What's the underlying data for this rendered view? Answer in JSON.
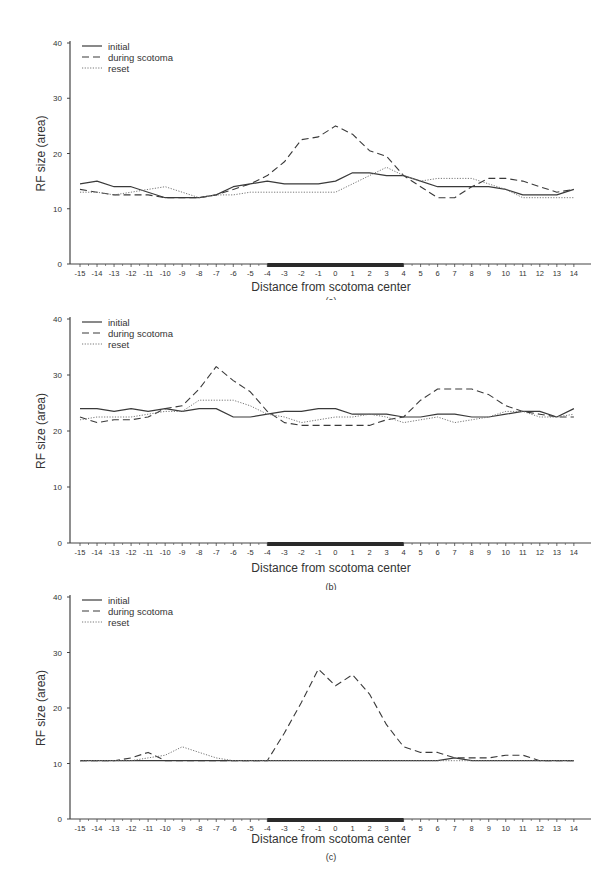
{
  "chart_data": [
    {
      "type": "line",
      "panel_label": "(a)",
      "title": "",
      "xlabel": "Distance from scotoma center",
      "ylabel": "RF size (area)",
      "ylim": [
        0,
        40
      ],
      "xlim": [
        -15,
        14
      ],
      "yticks": [
        0,
        10,
        20,
        30,
        40
      ],
      "x": [
        -15,
        -14,
        -13,
        -12,
        -11,
        -10,
        -9,
        -8,
        -7,
        -6,
        -5,
        -4,
        -3,
        -2,
        -1,
        0,
        1,
        2,
        3,
        4,
        5,
        6,
        7,
        8,
        9,
        10,
        11,
        12,
        13,
        14
      ],
      "scotoma_range": [
        -4,
        4
      ],
      "legend": [
        "initial",
        "during scotoma",
        "reset"
      ],
      "legend_position": "upper left",
      "grid": false,
      "series": [
        {
          "name": "initial",
          "style": "solid",
          "values": [
            14.5,
            15,
            14,
            14,
            13,
            12,
            12,
            12,
            12.5,
            14,
            14.5,
            15,
            14.5,
            14.5,
            14.5,
            15,
            16.5,
            16.5,
            16,
            16,
            15,
            14,
            14,
            14,
            14,
            13.5,
            12.5,
            12.5,
            12.5,
            13.5
          ]
        },
        {
          "name": "during scotoma",
          "style": "dashed",
          "values": [
            13.5,
            13,
            12.5,
            12.5,
            12.5,
            12,
            12,
            12,
            12.5,
            13.5,
            14.5,
            16,
            18.5,
            22.5,
            23,
            25,
            23.5,
            20.5,
            19.5,
            16,
            14,
            12,
            12,
            14,
            15.5,
            15.5,
            15,
            14,
            13,
            13.5
          ]
        },
        {
          "name": "reset",
          "style": "dotted",
          "values": [
            13,
            13,
            12.5,
            13,
            13.5,
            14,
            13,
            12,
            12.5,
            12.5,
            13,
            13,
            13,
            13,
            13,
            13,
            14.5,
            16,
            17.5,
            16,
            15,
            15.5,
            15.5,
            15.5,
            14.5,
            13.5,
            12,
            12,
            12,
            12
          ]
        }
      ]
    },
    {
      "type": "line",
      "panel_label": "(b)",
      "title": "",
      "xlabel": "Distance from scotoma center",
      "ylabel": "RF size (area)",
      "ylim": [
        0,
        40
      ],
      "xlim": [
        -15,
        14
      ],
      "yticks": [
        0,
        10,
        20,
        30,
        40
      ],
      "x": [
        -15,
        -14,
        -13,
        -12,
        -11,
        -10,
        -9,
        -8,
        -7,
        -6,
        -5,
        -4,
        -3,
        -2,
        -1,
        0,
        1,
        2,
        3,
        4,
        5,
        6,
        7,
        8,
        9,
        10,
        11,
        12,
        13,
        14
      ],
      "scotoma_range": [
        -4,
        4
      ],
      "legend": [
        "initial",
        "during scotoma",
        "reset"
      ],
      "legend_position": "upper left",
      "grid": false,
      "series": [
        {
          "name": "initial",
          "style": "solid",
          "values": [
            24,
            24,
            23.5,
            24,
            23.5,
            24,
            23.5,
            24,
            24,
            22.5,
            22.5,
            23,
            23.5,
            23.5,
            24,
            24,
            23,
            23,
            23,
            22.5,
            22.5,
            23,
            23,
            22.5,
            22.5,
            23,
            23.5,
            23.5,
            22.5,
            24
          ]
        },
        {
          "name": "during scotoma",
          "style": "dashed",
          "values": [
            22.5,
            21.5,
            22,
            22,
            22.5,
            24,
            24.5,
            27.5,
            31.5,
            29,
            27,
            23.5,
            21.5,
            21,
            21,
            21,
            21,
            21,
            22,
            22.5,
            25.5,
            27.5,
            27.5,
            27.5,
            26.5,
            24.5,
            23.5,
            23,
            22.5,
            22.5
          ]
        },
        {
          "name": "reset",
          "style": "dotted",
          "values": [
            22,
            22.5,
            22.5,
            22.5,
            23,
            23.5,
            23.5,
            25.5,
            25.5,
            25.5,
            24.5,
            23,
            22.5,
            21.5,
            22,
            22.5,
            22.5,
            23,
            22.5,
            21.5,
            22,
            22.5,
            21.5,
            22,
            22.5,
            23.5,
            23.5,
            22.5,
            22.5,
            23
          ]
        }
      ]
    },
    {
      "type": "line",
      "panel_label": "(c)",
      "title": "",
      "xlabel": "Distance from scotoma center",
      "ylabel": "RF size (area)",
      "ylim": [
        0,
        40
      ],
      "xlim": [
        -15,
        14
      ],
      "yticks": [
        0,
        10,
        20,
        30,
        40
      ],
      "x": [
        -15,
        -14,
        -13,
        -12,
        -11,
        -10,
        -9,
        -8,
        -7,
        -6,
        -5,
        -4,
        -3,
        -2,
        -1,
        0,
        1,
        2,
        3,
        4,
        5,
        6,
        7,
        8,
        9,
        10,
        11,
        12,
        13,
        14
      ],
      "scotoma_range": [
        -4,
        4
      ],
      "legend": [
        "initial",
        "during scotoma",
        "reset"
      ],
      "legend_position": "upper left",
      "grid": false,
      "series": [
        {
          "name": "initial",
          "style": "solid",
          "values": [
            10.5,
            10.5,
            10.5,
            10.5,
            10.5,
            10.5,
            10.5,
            10.5,
            10.5,
            10.5,
            10.5,
            10.5,
            10.5,
            10.5,
            10.5,
            10.5,
            10.5,
            10.5,
            10.5,
            10.5,
            10.5,
            10.5,
            11,
            10.5,
            10.5,
            10.5,
            10.5,
            10.5,
            10.5,
            10.5
          ]
        },
        {
          "name": "during scotoma",
          "style": "dashed",
          "values": [
            10.5,
            10.5,
            10.5,
            11,
            12,
            10.5,
            10.5,
            10.5,
            10.5,
            10.5,
            10.5,
            10.5,
            15.5,
            21,
            27,
            24,
            26,
            22.5,
            17,
            13,
            12,
            12,
            11,
            11,
            11,
            11.5,
            11.5,
            10.5,
            10.5,
            10.5
          ]
        },
        {
          "name": "reset",
          "style": "dotted",
          "values": [
            10.5,
            10.5,
            10.5,
            10.5,
            11,
            11.5,
            13,
            12,
            11,
            10.5,
            10.5,
            10.5,
            10.5,
            10.5,
            10.5,
            10.5,
            10.5,
            10.5,
            10.5,
            10.5,
            10.5,
            10.5,
            10.5,
            10.5,
            10.5,
            10.5,
            10.5,
            10.5,
            10.5,
            10.5
          ]
        }
      ]
    }
  ],
  "panels": [
    {
      "label": "(a)",
      "xlabel": "Distance from scotoma center",
      "ylabel": "RF size (area)",
      "legend": [
        "initial",
        "during scotoma",
        "reset"
      ]
    },
    {
      "label": "(b)",
      "xlabel": "Distance from scotoma center",
      "ylabel": "RF size (area)",
      "legend": [
        "initial",
        "during scotoma",
        "reset"
      ]
    },
    {
      "label": "(c)",
      "xlabel": "Distance from scotoma center",
      "ylabel": "RF size (area)",
      "legend": [
        "initial",
        "during scotoma",
        "reset"
      ]
    }
  ],
  "colors": {
    "line": "#3a3a3a",
    "dotted": "#777777",
    "axis": "#444444",
    "scotoma_bar": "#2a2a2a"
  }
}
